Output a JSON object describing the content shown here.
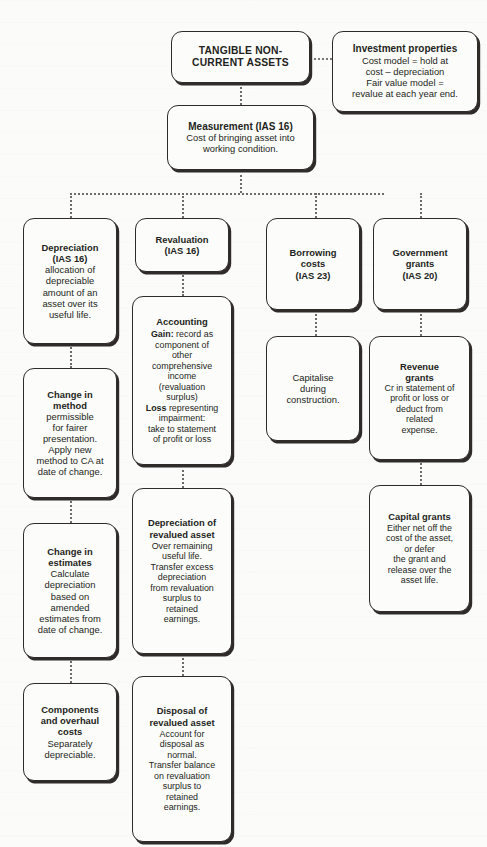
{
  "diagram": {
    "accent_color": "#2f2b29",
    "connector_color": "#6e6a67",
    "background_color": "#fbfbfa"
  },
  "nodes": {
    "root": {
      "heading": "TANGIBLE NON-CURRENT ASSETS"
    },
    "investment_properties": {
      "heading": "Investment properties",
      "lines": [
        "Cost model = hold at",
        "cost – depreciation",
        "Fair value model =",
        "revalue at each year end."
      ]
    },
    "measurement": {
      "heading": "Measurement (IAS 16)",
      "lines": [
        "Cost of bringing asset into",
        "working condition."
      ]
    },
    "depreciation": {
      "heading_lines": [
        "Depreciation",
        "(IAS 16)"
      ],
      "lines": [
        "allocation of",
        "depreciable",
        "amount of an",
        "asset over its",
        "useful life."
      ]
    },
    "change_in_method": {
      "heading_lines": [
        "Change in",
        "method"
      ],
      "lines": [
        "permissible",
        "for fairer",
        "presentation.",
        "Apply new",
        "method to CA at",
        "date of change."
      ]
    },
    "change_in_estimates": {
      "heading_lines": [
        "Change in",
        "estimates"
      ],
      "lines": [
        "Calculate",
        "depreciation",
        "based on",
        "amended",
        "estimates from",
        "date of change."
      ]
    },
    "components_overhaul": {
      "heading_lines": [
        "Components",
        "and overhaul",
        "costs"
      ],
      "lines": [
        "Separately",
        "depreciable."
      ]
    },
    "revaluation": {
      "heading_lines": [
        "Revaluation",
        "(IAS 16)"
      ]
    },
    "accounting": {
      "heading": "Accounting",
      "gain_label": "Gain:",
      "gain_lines": [
        " record as",
        "component of",
        "other",
        "comprehensive",
        "income",
        "(revaluation",
        "surplus)"
      ],
      "loss_label": "Loss",
      "loss_lines": [
        " representing",
        "impairment:",
        "take to statement",
        "of profit or loss"
      ]
    },
    "depreciation_revalued": {
      "heading_lines": [
        "Depreciation of",
        "revalued asset"
      ],
      "lines": [
        "Over remaining",
        "useful life.",
        "Transfer excess",
        "depreciation",
        "from revaluation",
        "surplus to",
        "retained",
        "earnings."
      ]
    },
    "disposal_revalued": {
      "heading_lines": [
        "Disposal of",
        "revalued asset"
      ],
      "lines": [
        "Account for",
        "disposal as",
        "normal.",
        "Transfer balance",
        "on revaluation",
        "surplus to",
        "retained",
        "earnings."
      ]
    },
    "borrowing_costs": {
      "heading_lines": [
        "Borrowing",
        "costs",
        "(IAS 23)"
      ]
    },
    "capitalise": {
      "lines": [
        "Capitalise",
        "during",
        "construction."
      ]
    },
    "government_grants": {
      "heading_lines": [
        "Government",
        "grants",
        "(IAS 20)"
      ]
    },
    "revenue_grants": {
      "heading_lines": [
        "Revenue",
        "grants"
      ],
      "lines": [
        "Cr in statement of",
        "profit or loss or",
        "deduct from",
        "related",
        "expense."
      ]
    },
    "capital_grants": {
      "heading": "Capital grants",
      "lines": [
        "Either net off the",
        "cost of the asset,",
        "or defer",
        "the grant and",
        "release over the",
        "asset life."
      ]
    }
  }
}
